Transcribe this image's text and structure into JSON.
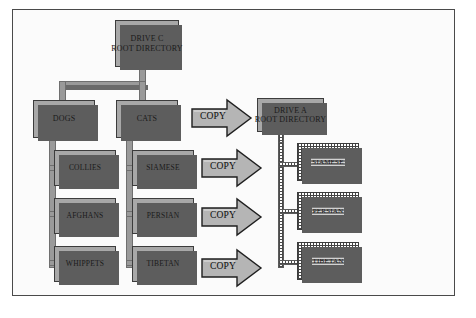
{
  "diagram": {
    "type": "tree",
    "source": {
      "root": {
        "line1": "DRIVE C",
        "line2": "ROOT DIRECTORY"
      },
      "branches": [
        {
          "label": "DOGS",
          "children": [
            {
              "label": "COLLIES"
            },
            {
              "label": "AFGHANS"
            },
            {
              "label": "WHIPPETS"
            }
          ]
        },
        {
          "label": "CATS",
          "children": [
            {
              "label": "SIAMESE"
            },
            {
              "label": "PERSIAN"
            },
            {
              "label": "TIBETAN"
            }
          ]
        }
      ]
    },
    "operations": [
      {
        "label": "COPY"
      },
      {
        "label": "COPY"
      },
      {
        "label": "COPY"
      },
      {
        "label": "COPY"
      }
    ],
    "destination": {
      "root": {
        "line1": "DRIVE A",
        "line2": "ROOT DIRECTORY"
      },
      "children": [
        {
          "label": "SIAMESE"
        },
        {
          "label": "PERSIAN"
        },
        {
          "label": "TIBETAN"
        }
      ]
    },
    "colors": {
      "box_fill": "#a8a8a8",
      "box_border": "#3c3c3c",
      "box_shadow": "#5d5d5d",
      "connector": "#9a9a9a",
      "arrow_fill": "#b5b5b5",
      "frame": "#4a4a4a",
      "page": "#ffffff"
    }
  }
}
